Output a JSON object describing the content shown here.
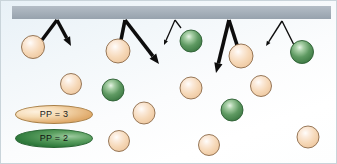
{
  "figure": {
    "name": "particle-scattering-diagram",
    "background_gradient_from": "#e8f1f7",
    "background_gradient_to": "#ffffff",
    "border_color": "#c9d4da"
  },
  "surface": {
    "name": "gray-surface-bar",
    "color_top": "#a9b3bd",
    "color_bottom": "#9aa5b0",
    "x": 11,
    "y": 5,
    "width": 319,
    "height": 13
  },
  "legend": {
    "items": [
      {
        "label": "PP = 3",
        "color": "#e0ab6c",
        "class": "pp3"
      },
      {
        "label": "PP = 2",
        "color": "#2f7a3c",
        "class": "pp2"
      }
    ]
  },
  "colors": {
    "peach_sphere": "#f3d2ae",
    "peach_sphere_edge": "#8b6a4a",
    "green_sphere": "#4e8f55",
    "green_sphere_edge": "#2c5f33",
    "arrow": "#0d0d0d"
  },
  "spheres": [
    {
      "cx": 32,
      "cy": 46,
      "r": 11.5,
      "color": "peach"
    },
    {
      "cx": 117,
      "cy": 50,
      "r": 12.0,
      "color": "peach"
    },
    {
      "cx": 190,
      "cy": 40,
      "r": 11.0,
      "color": "green"
    },
    {
      "cx": 240,
      "cy": 55,
      "r": 12.0,
      "color": "peach"
    },
    {
      "cx": 301,
      "cy": 51,
      "r": 11.5,
      "color": "green"
    },
    {
      "cx": 70,
      "cy": 83,
      "r": 10.5,
      "color": "peach"
    },
    {
      "cx": 112,
      "cy": 89,
      "r": 11.0,
      "color": "green"
    },
    {
      "cx": 190,
      "cy": 87,
      "r": 11.0,
      "color": "peach"
    },
    {
      "cx": 260,
      "cy": 85,
      "r": 10.5,
      "color": "peach"
    },
    {
      "cx": 143,
      "cy": 112,
      "r": 11.0,
      "color": "peach"
    },
    {
      "cx": 231,
      "cy": 109,
      "r": 11.0,
      "color": "green"
    },
    {
      "cx": 118,
      "cy": 140,
      "r": 10.5,
      "color": "peach"
    },
    {
      "cx": 208,
      "cy": 144,
      "r": 10.5,
      "color": "peach"
    },
    {
      "cx": 307,
      "cy": 136,
      "r": 11.0,
      "color": "peach"
    }
  ],
  "arrows": [
    {
      "name": "incoming-arrow-1",
      "x1": 41,
      "y1": 39,
      "x2": 56,
      "y2": 19,
      "width": 3.4,
      "head": false
    },
    {
      "name": "outgoing-arrow-1",
      "x1": 56,
      "y1": 19,
      "x2": 70,
      "y2": 45,
      "width": 3.4,
      "head": true,
      "head_size": 9
    },
    {
      "name": "incoming-arrow-2",
      "x1": 120,
      "y1": 39,
      "x2": 124,
      "y2": 19,
      "width": 3.6,
      "head": false
    },
    {
      "name": "outgoing-arrow-2",
      "x1": 124,
      "y1": 19,
      "x2": 158,
      "y2": 63,
      "width": 3.6,
      "head": true,
      "head_size": 10
    },
    {
      "name": "incoming-arrow-3",
      "x1": 180,
      "y1": 27,
      "x2": 174,
      "y2": 19,
      "width": 1.3,
      "head": false
    },
    {
      "name": "outgoing-arrow-3",
      "x1": 174,
      "y1": 19,
      "x2": 163,
      "y2": 44,
      "width": 1.3,
      "head": true,
      "head_size": 5
    },
    {
      "name": "incoming-arrow-4",
      "x1": 236,
      "y1": 44,
      "x2": 228,
      "y2": 19,
      "width": 3.6,
      "head": false
    },
    {
      "name": "outgoing-arrow-4",
      "x1": 228,
      "y1": 19,
      "x2": 215,
      "y2": 72,
      "width": 3.6,
      "head": true,
      "head_size": 10
    },
    {
      "name": "incoming-arrow-5",
      "x1": 293,
      "y1": 44,
      "x2": 281,
      "y2": 20,
      "width": 1.4,
      "head": false
    },
    {
      "name": "outgoing-arrow-5",
      "x1": 281,
      "y1": 20,
      "x2": 265,
      "y2": 45,
      "width": 1.4,
      "head": true,
      "head_size": 5
    }
  ]
}
